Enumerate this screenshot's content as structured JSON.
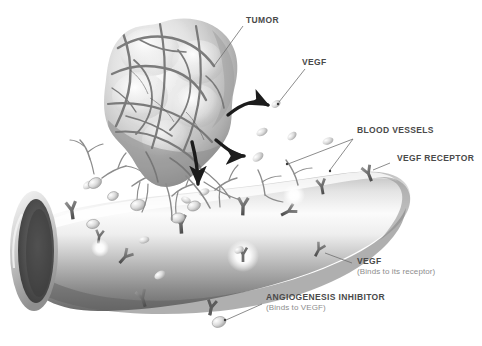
{
  "figure": {
    "background_color": "#ffffff",
    "label_color": "#4a4a4a",
    "sublabel_color": "#8d8d8d",
    "leader_line_color": "#6e6e6e",
    "arrow_color": "#1c1c1c"
  },
  "labels": {
    "tumor": "TUMOR",
    "vegf_top": "VEGF",
    "blood_vessels": "BLOOD VESSELS",
    "vegf_receptor": "VEGF RECEPTOR",
    "vegf_right": "VEGF",
    "vegf_right_note": "(Binds to its receptor)",
    "angiogenesis_inhibitor": "ANGIOGENESIS INHIBITOR",
    "angiogenesis_inhibitor_note": "(Binds to VEGF)"
  },
  "elements": {
    "tumor_mass": "tumor-mass",
    "blood_vessel": "blood-vessel",
    "vessel_lumen": "vessel-lumen",
    "vegf_particles": "vegf-particle",
    "vegf_receptors": "vegf-receptor-y-shape",
    "sprouting_vessels": "sprouting-vessel",
    "inhibitor_molecule": "angiogenesis-inhibitor-molecule",
    "binding_flash": "receptor-binding-flash",
    "signal_arrows": "vegf-signal-arrow"
  },
  "counts": {
    "signal_arrows": 3,
    "leader_lines": 7
  }
}
